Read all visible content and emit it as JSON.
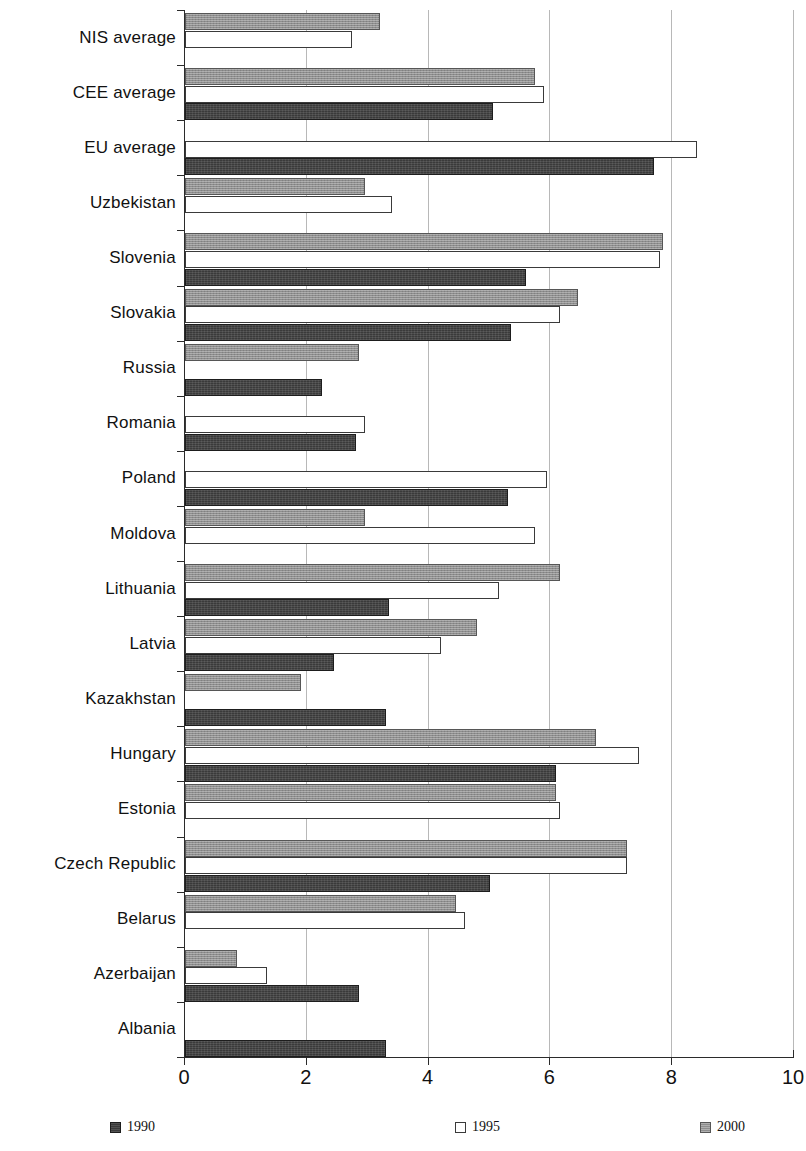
{
  "chart_data": {
    "type": "bar",
    "orientation": "horizontal",
    "title": "",
    "subtitle": "",
    "xlabel": "",
    "ylabel": "",
    "xlim": [
      0,
      10
    ],
    "ylim": null,
    "xticks": [
      "0",
      "2",
      "4",
      "6",
      "8",
      "10"
    ],
    "xtick_values": [
      0,
      2,
      4,
      6,
      8,
      10
    ],
    "grid": "vertical",
    "legend_position": "bottom",
    "categories": [
      "NIS average",
      "CEE average",
      "EU average",
      "Uzbekistan",
      "Slovenia",
      "Slovakia",
      "Russia",
      "Romania",
      "Poland",
      "Moldova",
      "Lithuania",
      "Latvia",
      "Kazakhstan",
      "Hungary",
      "Estonia",
      "Czech Republic",
      "Belarus",
      "Azerbaijan",
      "Albania"
    ],
    "series": [
      {
        "name": "1990",
        "color": "#3a3a3a",
        "values": [
          null,
          5.05,
          7.7,
          null,
          5.6,
          5.35,
          2.25,
          2.8,
          5.3,
          null,
          3.35,
          2.45,
          3.3,
          6.1,
          null,
          5.0,
          null,
          2.85,
          3.3
        ]
      },
      {
        "name": "1995",
        "color": "#ffffff",
        "values": [
          2.75,
          5.9,
          8.4,
          3.4,
          7.8,
          6.15,
          null,
          2.95,
          5.95,
          5.75,
          5.15,
          4.2,
          null,
          7.45,
          6.15,
          7.25,
          4.6,
          1.35,
          null
        ]
      },
      {
        "name": "2000",
        "color": "#8e8e8e",
        "values": [
          3.2,
          5.75,
          null,
          2.95,
          7.85,
          6.45,
          2.85,
          null,
          null,
          2.95,
          6.15,
          4.8,
          1.9,
          6.75,
          6.1,
          7.25,
          4.45,
          0.85,
          null
        ]
      }
    ]
  },
  "legend": {
    "items": [
      {
        "label": "1990",
        "swatch": "dark-hatched-square"
      },
      {
        "label": "1995",
        "swatch": "white-outline-square"
      },
      {
        "label": "2000",
        "swatch": "gray-hatched-square"
      }
    ]
  }
}
